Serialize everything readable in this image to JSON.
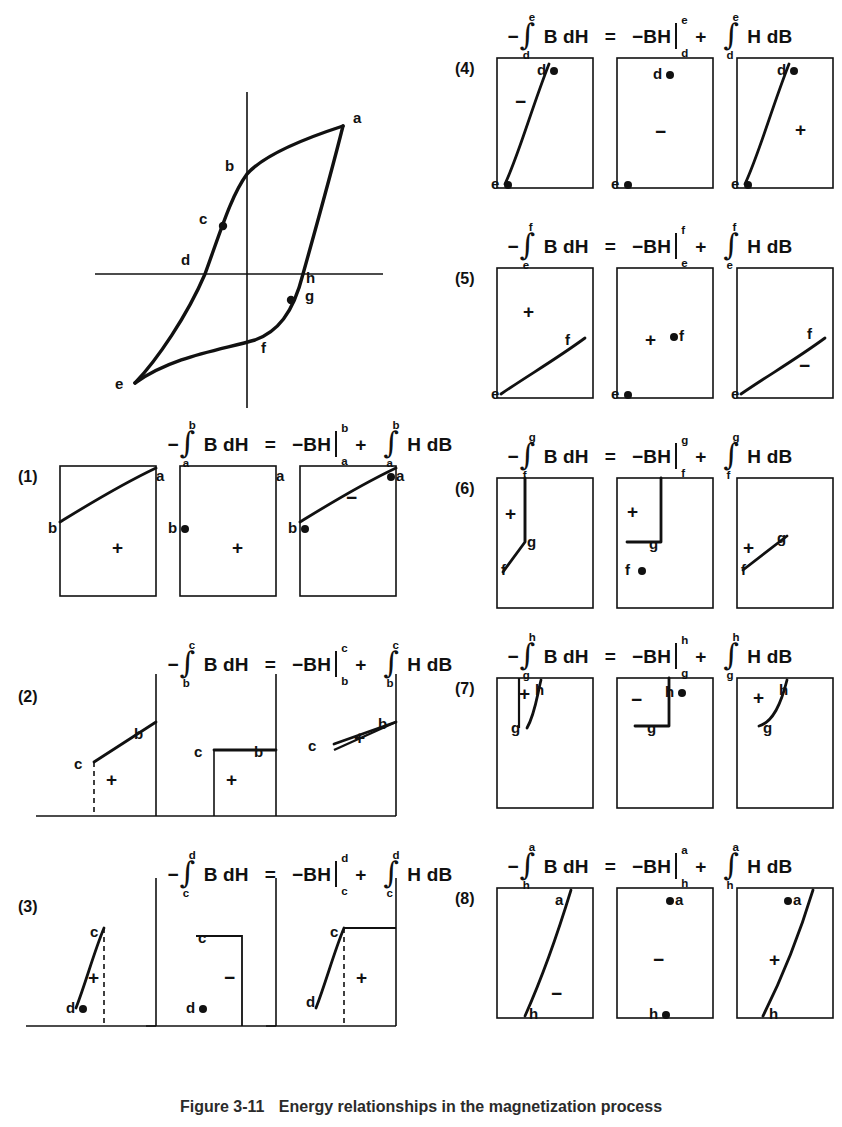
{
  "figure": {
    "caption_number": "Figure 3-11",
    "caption_text": "Energy relationships in the magnetization process"
  },
  "loop_diagram": {
    "name": "hysteresis-loop",
    "points": [
      {
        "label": "a",
        "x": 248,
        "y": 48,
        "dot": false,
        "lx": 258,
        "ly": 36
      },
      {
        "label": "b",
        "x": 152,
        "y": 96,
        "dot": false,
        "lx": 132,
        "ly": 84
      },
      {
        "label": "c",
        "x": 128,
        "y": 148,
        "dot": true,
        "lx": 106,
        "ly": 136
      },
      {
        "label": "d",
        "x": 110,
        "y": 196,
        "dot": false,
        "lx": 88,
        "ly": 180
      },
      {
        "label": "e",
        "x": 40,
        "y": 305,
        "dot": false,
        "lx": 22,
        "ly": 300
      },
      {
        "label": "f",
        "x": 160,
        "y": 262,
        "dot": false,
        "lx": 168,
        "ly": 262
      },
      {
        "label": "g",
        "x": 196,
        "y": 222,
        "dot": true,
        "lx": 210,
        "ly": 212
      },
      {
        "label": "h",
        "x": 208,
        "y": 196,
        "dot": false,
        "lx": 210,
        "ly": 192
      }
    ],
    "axes": {
      "h_axis_label": "",
      "v_axis_label": ""
    }
  },
  "panels": [
    {
      "number": "(1)",
      "equation": {
        "lhs_sign": "−",
        "lhs_int_lower": "a",
        "lhs_int_upper": "b",
        "lhs_body": "B dH",
        "equals": "=",
        "mid_sign": "−",
        "mid_body": "BH",
        "mid_lower": "a",
        "mid_upper": "b",
        "plus": "+",
        "rhs_int_lower": "a",
        "rhs_int_upper": "b",
        "rhs_body": "H dB"
      },
      "boxes": [
        {
          "signs": [
            {
              "t": "+",
              "x": 52,
              "y": 72
            }
          ],
          "labels": [
            {
              "t": "a",
              "x": 96,
              "y": 2,
              "dot": false
            },
            {
              "t": "b",
              "x": -12,
              "y": 54,
              "dot": false
            }
          ]
        },
        {
          "signs": [
            {
              "t": "+",
              "x": 52,
              "y": 72
            }
          ],
          "labels": [
            {
              "t": "a",
              "x": 96,
              "y": 2,
              "dot": false
            },
            {
              "t": "b",
              "x": -12,
              "y": 54,
              "dot": true
            }
          ]
        },
        {
          "signs": [
            {
              "t": "−",
              "x": 46,
              "y": 22
            }
          ],
          "labels": [
            {
              "t": "a",
              "x": 96,
              "y": 2,
              "dot": true
            },
            {
              "t": "b",
              "x": -12,
              "y": 54,
              "dot": true
            }
          ]
        }
      ]
    },
    {
      "number": "(2)",
      "equation": {
        "lhs_sign": "−",
        "lhs_int_lower": "b",
        "lhs_int_upper": "c",
        "lhs_body": "B dH",
        "equals": "=",
        "mid_sign": "−",
        "mid_body": "BH",
        "mid_lower": "b",
        "mid_upper": "c",
        "plus": "+",
        "rhs_int_lower": "b",
        "rhs_int_upper": "c",
        "rhs_body": "H dB"
      },
      "boxes": [
        {
          "signs": [
            {
              "t": "+",
              "x": 46,
              "y": 84
            }
          ],
          "labels": [
            {
              "t": "b",
              "x": 74,
              "y": 40,
              "dot": false
            },
            {
              "t": "c",
              "x": 14,
              "y": 70,
              "dot": false
            }
          ]
        },
        {
          "signs": [
            {
              "t": "+",
              "x": 46,
              "y": 84
            }
          ],
          "labels": [
            {
              "t": "b",
              "x": 74,
              "y": 58,
              "dot": false
            },
            {
              "t": "c",
              "x": 14,
              "y": 58,
              "dot": false
            }
          ]
        },
        {
          "signs": [
            {
              "t": "+",
              "x": 54,
              "y": 42
            }
          ],
          "labels": [
            {
              "t": "b",
              "x": 78,
              "y": 30,
              "dot": false
            },
            {
              "t": "c",
              "x": 8,
              "y": 52,
              "dot": false
            }
          ]
        }
      ]
    },
    {
      "number": "(3)",
      "equation": {
        "lhs_sign": "−",
        "lhs_int_lower": "c",
        "lhs_int_upper": "d",
        "lhs_body": "B dH",
        "equals": "=",
        "mid_sign": "−",
        "mid_body": "BH",
        "mid_lower": "c",
        "mid_upper": "d",
        "plus": "+",
        "rhs_int_lower": "c",
        "rhs_int_upper": "d",
        "rhs_body": "H dB"
      },
      "boxes": [
        {
          "signs": [
            {
              "t": "+",
              "x": 28,
              "y": 72
            }
          ],
          "labels": [
            {
              "t": "c",
              "x": 30,
              "y": 28,
              "dot": false
            },
            {
              "t": "d",
              "x": 6,
              "y": 104,
              "dot": true
            }
          ]
        },
        {
          "signs": [
            {
              "t": "−",
              "x": 44,
              "y": 72
            }
          ],
          "labels": [
            {
              "t": "c",
              "x": 18,
              "y": 34,
              "dot": false
            },
            {
              "t": "d",
              "x": 6,
              "y": 104,
              "dot": true
            }
          ]
        },
        {
          "signs": [
            {
              "t": "+",
              "x": 56,
              "y": 72
            }
          ],
          "labels": [
            {
              "t": "c",
              "x": 30,
              "y": 28,
              "dot": false
            },
            {
              "t": "d",
              "x": 6,
              "y": 98,
              "dot": false
            }
          ]
        }
      ]
    },
    {
      "number": "(4)",
      "equation": {
        "lhs_sign": "−",
        "lhs_int_lower": "d",
        "lhs_int_upper": "e",
        "lhs_body": "B dH",
        "equals": "=",
        "mid_sign": "−",
        "mid_body": "BH",
        "mid_lower": "d",
        "mid_upper": "e",
        "plus": "+",
        "rhs_int_lower": "d",
        "rhs_int_upper": "e",
        "rhs_body": "H dB"
      },
      "boxes": [
        {
          "signs": [
            {
              "t": "−",
              "x": 18,
              "y": 34
            }
          ],
          "labels": [
            {
              "t": "d",
              "x": 40,
              "y": 4,
              "dot": true
            },
            {
              "t": "e",
              "x": -6,
              "y": 118,
              "dot": true
            }
          ]
        },
        {
          "signs": [
            {
              "t": "−",
              "x": 38,
              "y": 64
            }
          ],
          "labels": [
            {
              "t": "d",
              "x": 36,
              "y": 8,
              "dot": true
            },
            {
              "t": "e",
              "x": -6,
              "y": 118,
              "dot": true
            }
          ]
        },
        {
          "signs": [
            {
              "t": "+",
              "x": 58,
              "y": 62
            }
          ],
          "labels": [
            {
              "t": "d",
              "x": 40,
              "y": 4,
              "dot": true
            },
            {
              "t": "e",
              "x": -6,
              "y": 118,
              "dot": true
            }
          ]
        }
      ]
    },
    {
      "number": "(5)",
      "equation": {
        "lhs_sign": "−",
        "lhs_int_lower": "e",
        "lhs_int_upper": "f",
        "lhs_body": "B dH",
        "equals": "=",
        "mid_sign": "−",
        "mid_body": "BH",
        "mid_lower": "e",
        "mid_upper": "f",
        "plus": "+",
        "rhs_int_lower": "e",
        "rhs_int_upper": "f",
        "rhs_body": "H dB"
      },
      "boxes": [
        {
          "signs": [
            {
              "t": "+",
              "x": 26,
              "y": 34
            }
          ],
          "labels": [
            {
              "t": "f",
              "x": 68,
              "y": 64,
              "dot": false
            },
            {
              "t": "e",
              "x": -6,
              "y": 118,
              "dot": false
            }
          ]
        },
        {
          "signs": [
            {
              "t": "+",
              "x": 28,
              "y": 62
            }
          ],
          "labels": [
            {
              "t": "f",
              "x": 62,
              "y": 60,
              "dot": true
            },
            {
              "t": "e",
              "x": -6,
              "y": 118,
              "dot": true
            }
          ]
        },
        {
          "signs": [
            {
              "t": "−",
              "x": 62,
              "y": 88
            }
          ],
          "labels": [
            {
              "t": "f",
              "x": 70,
              "y": 58,
              "dot": false
            },
            {
              "t": "e",
              "x": -6,
              "y": 118,
              "dot": false
            }
          ]
        }
      ]
    },
    {
      "number": "(6)",
      "equation": {
        "lhs_sign": "−",
        "lhs_int_lower": "f",
        "lhs_int_upper": "g",
        "lhs_body": "B dH",
        "equals": "=",
        "mid_sign": "−",
        "mid_body": "BH",
        "mid_lower": "f",
        "mid_upper": "g",
        "plus": "+",
        "rhs_int_lower": "f",
        "rhs_int_upper": "g",
        "rhs_body": "H dB"
      },
      "boxes": [
        {
          "signs": [
            {
              "t": "+",
              "x": 8,
              "y": 26
            }
          ],
          "labels": [
            {
              "t": "g",
              "x": 30,
              "y": 56,
              "dot": false
            },
            {
              "t": "f",
              "x": 4,
              "y": 84,
              "dot": false
            }
          ]
        },
        {
          "signs": [
            {
              "t": "+",
              "x": 10,
              "y": 24
            }
          ],
          "labels": [
            {
              "t": "g",
              "x": 32,
              "y": 58,
              "dot": false
            },
            {
              "t": "f",
              "x": 8,
              "y": 84,
              "dot": true
            }
          ]
        },
        {
          "signs": [
            {
              "t": "+",
              "x": 6,
              "y": 60
            }
          ],
          "labels": [
            {
              "t": "g",
              "x": 40,
              "y": 52,
              "dot": false
            },
            {
              "t": "f",
              "x": 4,
              "y": 84,
              "dot": false
            }
          ]
        }
      ]
    },
    {
      "number": "(7)",
      "equation": {
        "lhs_sign": "−",
        "lhs_int_lower": "g",
        "lhs_int_upper": "h",
        "lhs_body": "B dH",
        "equals": "=",
        "mid_sign": "−",
        "mid_body": "BH",
        "mid_lower": "g",
        "mid_upper": "h",
        "plus": "+",
        "rhs_int_lower": "g",
        "rhs_int_upper": "h",
        "rhs_body": "H dB"
      },
      "boxes": [
        {
          "signs": [
            {
              "t": "+",
              "x": 22,
              "y": 6
            }
          ],
          "labels": [
            {
              "t": "h",
              "x": 38,
              "y": 4,
              "dot": false
            },
            {
              "t": "g",
              "x": 14,
              "y": 42,
              "dot": false
            }
          ]
        },
        {
          "signs": [
            {
              "t": "−",
              "x": 14,
              "y": 12
            }
          ],
          "labels": [
            {
              "t": "h",
              "x": 48,
              "y": 6,
              "dot": true
            },
            {
              "t": "g",
              "x": 30,
              "y": 42,
              "dot": false
            }
          ]
        },
        {
          "signs": [
            {
              "t": "+",
              "x": 16,
              "y": 10
            }
          ],
          "labels": [
            {
              "t": "h",
              "x": 42,
              "y": 4,
              "dot": false
            },
            {
              "t": "g",
              "x": 26,
              "y": 42,
              "dot": false
            }
          ]
        }
      ]
    },
    {
      "number": "(8)",
      "equation": {
        "lhs_sign": "−",
        "lhs_int_lower": "h",
        "lhs_int_upper": "a",
        "lhs_body": "B dH",
        "equals": "=",
        "mid_sign": "−",
        "mid_body": "BH",
        "mid_lower": "h",
        "mid_upper": "a",
        "plus": "+",
        "rhs_int_lower": "h",
        "rhs_int_upper": "a",
        "rhs_body": "H dB"
      },
      "boxes": [
        {
          "signs": [
            {
              "t": "−",
              "x": 54,
              "y": 96
            }
          ],
          "labels": [
            {
              "t": "a",
              "x": 58,
              "y": 4,
              "dot": false
            },
            {
              "t": "h",
              "x": 32,
              "y": 118,
              "dot": false
            }
          ]
        },
        {
          "signs": [
            {
              "t": "−",
              "x": 36,
              "y": 62
            }
          ],
          "labels": [
            {
              "t": "a",
              "x": 58,
              "y": 4,
              "dot": true
            },
            {
              "t": "h",
              "x": 32,
              "y": 118,
              "dot": true
            }
          ]
        },
        {
          "signs": [
            {
              "t": "+",
              "x": 32,
              "y": 62
            }
          ],
          "labels": [
            {
              "t": "a",
              "x": 56,
              "y": 4,
              "dot": true
            },
            {
              "t": "h",
              "x": 32,
              "y": 118,
              "dot": false
            }
          ]
        }
      ]
    }
  ]
}
